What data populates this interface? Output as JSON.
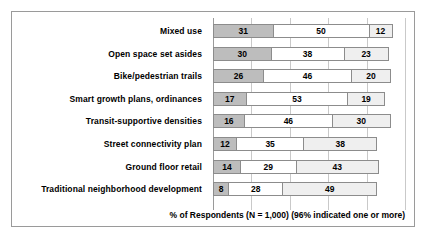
{
  "footer": {
    "axis_note": "% of Respondents (N = 1,000) (96% indicated one or more)"
  },
  "colors": {
    "segment_1": "#bdbdbd",
    "segment_2": "#ffffff",
    "segment_3": "#efefef",
    "border": "#8c8c8c",
    "gridline": "#c9c9c9",
    "frame": "#9a9a9a"
  },
  "chart_data": {
    "type": "bar",
    "title": "",
    "subtitle": "",
    "orientation": "horizontal",
    "stacked": true,
    "xlabel": "% of Respondents (N = 1,000) (96% indicated one or more)",
    "ylabel": "",
    "xlim": [
      0,
      100
    ],
    "grid": true,
    "gridline_values": [
      0,
      20,
      40,
      60,
      80,
      100
    ],
    "legend_position": "none",
    "categories": [
      "Mixed use",
      "Open space set asides",
      "Bike/pedestrian trails",
      "Smart growth plans, ordinances",
      "Transit-supportive densities",
      "Street connectivity plan",
      "Ground floor retail",
      "Traditional neighborhood development"
    ],
    "series": [
      {
        "name": "Segment 1",
        "values": [
          31,
          30,
          26,
          17,
          16,
          12,
          14,
          8
        ]
      },
      {
        "name": "Segment 2",
        "values": [
          50,
          38,
          46,
          53,
          46,
          35,
          29,
          28
        ]
      },
      {
        "name": "Segment 3",
        "values": [
          12,
          23,
          20,
          19,
          30,
          38,
          43,
          49
        ]
      }
    ],
    "rows": [
      {
        "label": "Mixed use",
        "values": [
          31,
          50,
          12
        ]
      },
      {
        "label": "Open space set asides",
        "values": [
          30,
          38,
          23
        ]
      },
      {
        "label": "Bike/pedestrian trails",
        "values": [
          26,
          46,
          20
        ]
      },
      {
        "label": "Smart growth plans, ordinances",
        "values": [
          17,
          53,
          19
        ]
      },
      {
        "label": "Transit-supportive densities",
        "values": [
          16,
          46,
          30
        ]
      },
      {
        "label": "Street connectivity plan",
        "values": [
          12,
          35,
          38
        ]
      },
      {
        "label": "Ground floor retail",
        "values": [
          14,
          29,
          43
        ]
      },
      {
        "label": "Traditional neighborhood development",
        "values": [
          8,
          28,
          49
        ]
      }
    ]
  }
}
